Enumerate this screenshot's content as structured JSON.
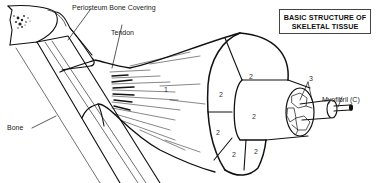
{
  "title": {
    "line1": "BASIC STRUCTURE OF",
    "line2": "SKELETAL TISSUE"
  },
  "labels": {
    "periosteum": "Periosteum Bone Covering",
    "tendon": "Tendon",
    "bone": "Bone",
    "myofibril": "Myofibril (C)"
  },
  "numbers": {
    "muscle": "1",
    "fascicle_a": "2",
    "fascicle_b": "2",
    "fascicle_c": "2",
    "fascicle_d": "2",
    "fascicle_e": "2",
    "fascicle_f": "2",
    "fiber": "3"
  },
  "colors": {
    "ink": "#111111",
    "background": "#ffffff"
  }
}
